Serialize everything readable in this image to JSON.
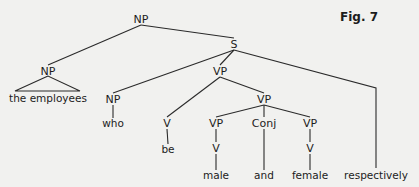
{
  "figure_label": "Fig. 7",
  "tree": {
    "root": {
      "id": "np_root",
      "label": "NP"
    },
    "nodes": [
      {
        "id": "np_root",
        "label": "NP",
        "kind": "category"
      },
      {
        "id": "s",
        "label": "S",
        "kind": "category"
      },
      {
        "id": "np_left",
        "label": "NP",
        "kind": "category"
      },
      {
        "id": "the_employees",
        "label": "the employees",
        "kind": "leaf",
        "triangle": true
      },
      {
        "id": "np_who",
        "label": "NP",
        "kind": "category"
      },
      {
        "id": "who",
        "label": "who",
        "kind": "leaf"
      },
      {
        "id": "vp_main",
        "label": "VP",
        "kind": "category"
      },
      {
        "id": "v_be",
        "label": "V",
        "kind": "category"
      },
      {
        "id": "be",
        "label": "be",
        "kind": "leaf"
      },
      {
        "id": "vp_coord",
        "label": "VP",
        "kind": "category"
      },
      {
        "id": "vp_male",
        "label": "VP",
        "kind": "category"
      },
      {
        "id": "v_male",
        "label": "V",
        "kind": "category"
      },
      {
        "id": "male",
        "label": "male",
        "kind": "leaf"
      },
      {
        "id": "conj",
        "label": "Conj",
        "kind": "category"
      },
      {
        "id": "and",
        "label": "and",
        "kind": "leaf"
      },
      {
        "id": "vp_female",
        "label": "VP",
        "kind": "category"
      },
      {
        "id": "v_female",
        "label": "V",
        "kind": "category"
      },
      {
        "id": "female",
        "label": "female",
        "kind": "leaf"
      },
      {
        "id": "respectively",
        "label": "respectively",
        "kind": "leaf"
      }
    ],
    "edges": [
      [
        "np_root",
        "np_left"
      ],
      [
        "np_root",
        "s"
      ],
      [
        "np_left",
        "the_employees"
      ],
      [
        "s",
        "np_who"
      ],
      [
        "s",
        "vp_main"
      ],
      [
        "s",
        "respectively"
      ],
      [
        "np_who",
        "who"
      ],
      [
        "vp_main",
        "v_be"
      ],
      [
        "vp_main",
        "vp_coord"
      ],
      [
        "v_be",
        "be"
      ],
      [
        "vp_coord",
        "vp_male"
      ],
      [
        "vp_coord",
        "conj"
      ],
      [
        "vp_coord",
        "vp_female"
      ],
      [
        "vp_male",
        "v_male"
      ],
      [
        "v_male",
        "male"
      ],
      [
        "conj",
        "and"
      ],
      [
        "vp_female",
        "v_female"
      ],
      [
        "v_female",
        "female"
      ]
    ]
  }
}
